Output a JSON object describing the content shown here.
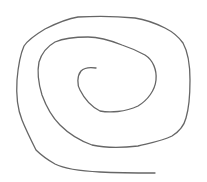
{
  "drawing": {
    "kind": "hand-drawn spiral",
    "stroke_color": "#666666",
    "stroke_width": 1.3,
    "background": "#ffffff"
  }
}
